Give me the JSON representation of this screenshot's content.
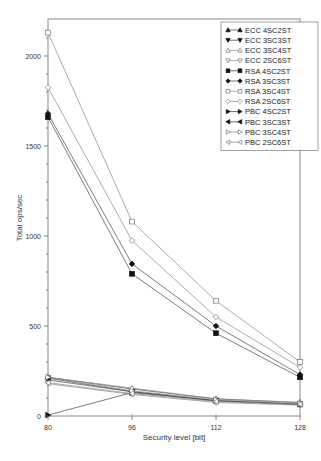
{
  "chart_data": {
    "type": "line",
    "title": "",
    "xlabel": "Security level [bit]",
    "ylabel": "Total ops/sec",
    "x": [
      80,
      96,
      112,
      128
    ],
    "xticks": [
      "80",
      "96",
      "112",
      "128"
    ],
    "yticks": [
      "0",
      "500",
      "1000",
      "1500",
      "2000"
    ],
    "ylim": [
      0,
      2200
    ],
    "grid": false,
    "legend_position": "upper right",
    "series": [
      {
        "name": "ECC 4SC2ST",
        "marker": "triangle-up-filled",
        "values": [
          215,
          150,
          95,
          75
        ]
      },
      {
        "name": "ECC 3SC3ST",
        "marker": "triangle-down-filled",
        "values": [
          200,
          135,
          85,
          65
        ]
      },
      {
        "name": "ECC 3SC4ST",
        "marker": "triangle-up-open",
        "values": [
          215,
          155,
          95,
          75
        ]
      },
      {
        "name": "ECC 2SC6ST",
        "marker": "triangle-down-open",
        "values": [
          180,
          120,
          75,
          60
        ]
      },
      {
        "name": "RSA 4SC2ST",
        "marker": "square-filled",
        "values": [
          1660,
          790,
          460,
          215
        ]
      },
      {
        "name": "RSA 3SC3ST",
        "marker": "diamond-filled",
        "values": [
          1680,
          845,
          500,
          230
        ]
      },
      {
        "name": "RSA 3SC4ST",
        "marker": "square-open",
        "values": [
          2130,
          1080,
          640,
          300
        ]
      },
      {
        "name": "RSA 2SC6ST",
        "marker": "diamond-open",
        "values": [
          1825,
          975,
          550,
          270
        ]
      },
      {
        "name": "PBC 4SC2ST",
        "marker": "triangle-right-filled",
        "values": [
          5,
          130,
          85,
          65
        ]
      },
      {
        "name": "PBC 3SC3ST",
        "marker": "triangle-left-filled",
        "values": [
          210,
          135,
          85,
          65
        ]
      },
      {
        "name": "PBC 3SC4ST",
        "marker": "triangle-right-open",
        "values": [
          215,
          140,
          90,
          70
        ]
      },
      {
        "name": "PBC 2SC6ST",
        "marker": "triangle-left-open",
        "values": [
          185,
          125,
          80,
          65
        ]
      }
    ]
  }
}
